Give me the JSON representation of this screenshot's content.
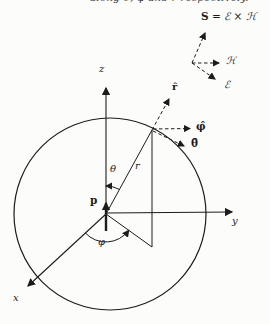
{
  "colors": {
    "ink": "#1c1c1c",
    "paper": "#fcfcfa"
  },
  "caption": {
    "fragment": "along θ̂, φ̂ and r̂ respectively."
  },
  "inset": {
    "equation_lhs": "S",
    "equation_rhs": " = ℰ × ℋ",
    "h_label": "ℋ",
    "e_label": "ℰ"
  },
  "axes": {
    "z_label": "z",
    "y_label": "y",
    "x_label": "x"
  },
  "geometry": {
    "radius_label": "r",
    "theta_label": "θ",
    "phi_label": "φ",
    "dipole_label": "p"
  },
  "unit_vectors": {
    "r_hat": "r̂",
    "phi_hat": "φ̂",
    "theta_hat": "θ̂"
  }
}
